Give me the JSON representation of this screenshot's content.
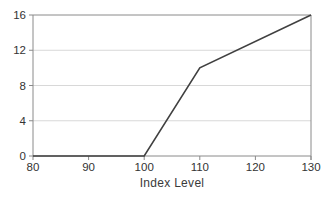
{
  "chart_data": {
    "type": "line",
    "title": "",
    "xlabel": "Index Level",
    "ylabel": "",
    "x": [
      80,
      100,
      110,
      130
    ],
    "y": [
      0,
      0,
      10,
      16
    ],
    "xlim": [
      80,
      130
    ],
    "ylim": [
      0,
      16
    ],
    "xticks": [
      80,
      90,
      100,
      110,
      120,
      130
    ],
    "yticks": [
      0,
      4,
      8,
      12,
      16
    ],
    "grid": "horizontal",
    "legend": "none",
    "colors": {
      "line": "#404040",
      "axis": "#8a8a8a",
      "gridline": "#d8d8d8",
      "tick_label": "#333333",
      "background": "#ffffff"
    }
  },
  "layout_px": {
    "width": 334,
    "height": 197,
    "plot_left": 33,
    "plot_right": 311,
    "plot_top": 15,
    "plot_bottom": 156
  }
}
